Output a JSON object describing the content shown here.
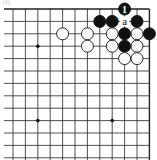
{
  "diagram": {
    "type": "go-board-fragment",
    "caption": "(1)",
    "columns": 12,
    "rows": 13,
    "edges": [
      "top",
      "right"
    ],
    "star_points": [
      [
        2,
        3
      ],
      [
        2,
        9
      ],
      [
        8,
        9
      ]
    ],
    "stones": [
      {
        "color": "black",
        "col": 9,
        "row": 0,
        "label": "1"
      },
      {
        "color": "black",
        "col": 7,
        "row": 1
      },
      {
        "color": "black",
        "col": 8,
        "row": 1
      },
      {
        "color": "black",
        "col": 10,
        "row": 1
      },
      {
        "color": "white",
        "col": 4,
        "row": 2
      },
      {
        "color": "white",
        "col": 6,
        "row": 2
      },
      {
        "color": "white",
        "col": 8,
        "row": 2
      },
      {
        "color": "black",
        "col": 9,
        "row": 2
      },
      {
        "color": "white",
        "col": 10,
        "row": 2
      },
      {
        "color": "black",
        "col": 11,
        "row": 2
      },
      {
        "color": "white",
        "col": 6,
        "row": 3
      },
      {
        "color": "white",
        "col": 8,
        "row": 3
      },
      {
        "color": "black",
        "col": 9,
        "row": 3
      },
      {
        "color": "white",
        "col": 10,
        "row": 3
      },
      {
        "color": "white",
        "col": 9,
        "row": 4
      },
      {
        "color": "white",
        "col": 10,
        "row": 4
      }
    ],
    "labels": [
      {
        "text": "a",
        "col": 9,
        "row": 1
      }
    ]
  }
}
